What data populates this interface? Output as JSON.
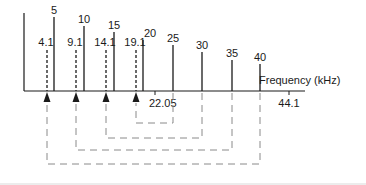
{
  "diagram": {
    "axis_label": "Frequency (kHz)",
    "ticks": [
      {
        "label": "22.05",
        "x": 155
      },
      {
        "label": "44.1",
        "x": 289
      }
    ],
    "input_lines": [
      {
        "label": "5",
        "x": 54,
        "top": 17
      },
      {
        "label": "10",
        "x": 84,
        "top": 26
      },
      {
        "label": "15",
        "x": 114,
        "top": 32
      },
      {
        "label": "20",
        "x": 143,
        "top": 40
      },
      {
        "label": "25",
        "x": 173,
        "top": 45
      },
      {
        "label": "30",
        "x": 202,
        "top": 52
      },
      {
        "label": "35",
        "x": 232,
        "top": 60
      },
      {
        "label": "40",
        "x": 260,
        "top": 64
      }
    ],
    "alias_lines": [
      {
        "label": "4.1",
        "x": 47,
        "top": 50,
        "source": "40",
        "source_x": 260,
        "connector_y": 164
      },
      {
        "label": "9.1",
        "x": 76,
        "top": 50,
        "source": "35",
        "source_x": 232,
        "connector_y": 150
      },
      {
        "label": "14.1",
        "x": 106,
        "top": 50,
        "source": "30",
        "source_x": 202,
        "connector_y": 138
      },
      {
        "label": "19.1",
        "x": 136,
        "top": 50,
        "source": "25",
        "source_x": 173,
        "connector_y": 123
      }
    ],
    "colors": {
      "line": "#1a1a1a",
      "dashed": "#8a8a8a"
    }
  }
}
